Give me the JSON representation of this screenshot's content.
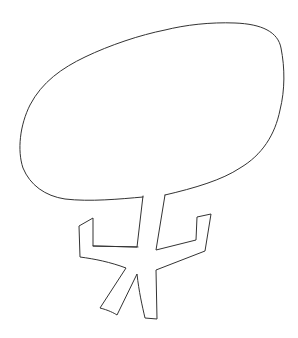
{
  "drawing": {
    "subject": "tree sketch",
    "stroke_color": "#333333",
    "background_color": "#ffffff"
  }
}
